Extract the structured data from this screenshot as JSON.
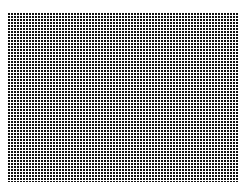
{
  "canvas": {
    "width": 246,
    "height": 191,
    "background_color": "#ffffff"
  },
  "pattern": {
    "name": "dot-grid",
    "description": "Uniform rectangular lattice of small dark square dots on a white field",
    "dot_color": "#111111",
    "gap_color": "#ffffff",
    "region": {
      "left": 8,
      "top": 12,
      "width": 230,
      "height": 170,
      "right": 238,
      "bottom": 182
    },
    "pitch_x": 3,
    "pitch_y": 3,
    "dot_width": 2,
    "dot_height": 2,
    "columns": 77,
    "rows": 57,
    "margins": {
      "left": 8,
      "top": 12,
      "right": 8,
      "bottom": 9
    }
  }
}
